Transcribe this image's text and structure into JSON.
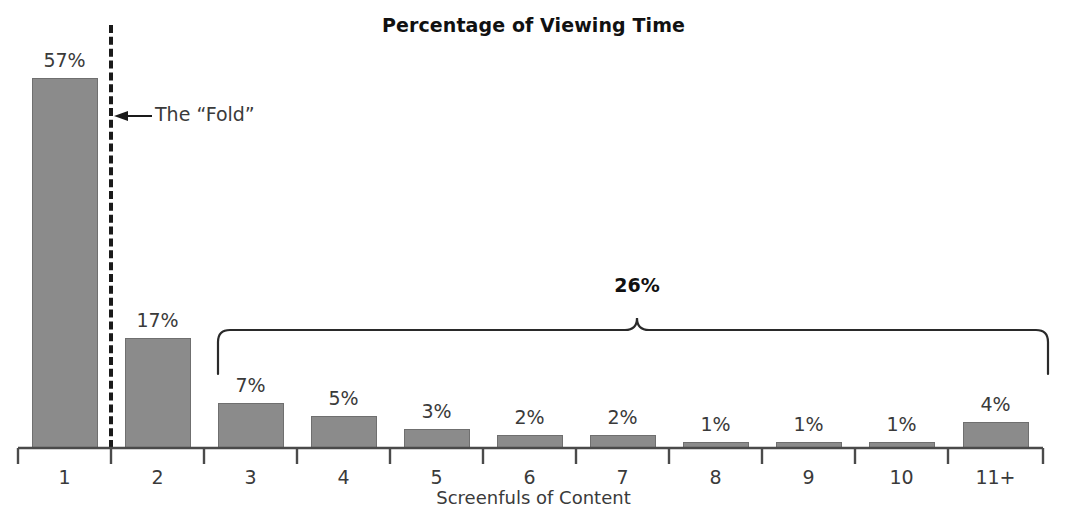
{
  "chart_data": {
    "type": "bar",
    "title": "Percentage of Viewing Time",
    "xlabel": "Screenfuls of Content",
    "ylabel": "",
    "ylim": [
      0,
      57
    ],
    "grid": false,
    "legend": "none",
    "categories": [
      "1",
      "2",
      "3",
      "4",
      "5",
      "6",
      "7",
      "8",
      "9",
      "10",
      "11+"
    ],
    "values": [
      57,
      17,
      7,
      5,
      3,
      2,
      2,
      1,
      1,
      1,
      4
    ],
    "value_labels": [
      "57%",
      "17%",
      "7%",
      "5%",
      "3%",
      "2%",
      "2%",
      "1%",
      "1%",
      "1%",
      "4%"
    ],
    "annotations": [
      {
        "name": "fold-marker",
        "label": "The “Fold”",
        "arrow": "←",
        "type": "vertical-dashed-line",
        "between_categories": [
          "1",
          "2"
        ]
      },
      {
        "name": "tail-brace",
        "label": "26%",
        "type": "curly-brace",
        "spans_categories": [
          "3",
          "4",
          "5",
          "6",
          "7",
          "8",
          "9",
          "10",
          "11+"
        ]
      }
    ],
    "colors": {
      "bar_fill": "#8b8b8b",
      "bar_stroke": "#6f6f6f",
      "axis": "#4a4a4a",
      "text": "#3a3a3a",
      "title": "#111111",
      "background": "#ffffff"
    }
  }
}
